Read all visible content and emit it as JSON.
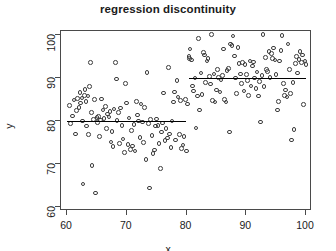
{
  "chart_data": {
    "type": "scatter",
    "title": "regression discontinuity",
    "xlabel": "x",
    "ylabel": "y",
    "xlim": [
      59,
      101
    ],
    "ylim": [
      59,
      101
    ],
    "grid": false,
    "legend": null,
    "xticks": [
      60,
      70,
      80,
      90,
      100
    ],
    "yticks": [
      60,
      70,
      80,
      90,
      100
    ],
    "xtick_labels": [
      "60",
      "70",
      "80",
      "90",
      "100"
    ],
    "ytick_labels": [
      "60",
      "70",
      "80",
      "90",
      "100"
    ],
    "marker": "open-circle",
    "marker_color": "#3c3c3c",
    "line_color": "#000000",
    "cutoff": 80,
    "annotations": [
      {
        "name": "left-segment-level",
        "value": 80.0
      },
      {
        "name": "right-segment-level",
        "value": 90.0
      },
      {
        "name": "discontinuity-jump",
        "value": 10.0
      }
    ],
    "series": [
      {
        "name": "observations",
        "type": "scatter",
        "points": [
          [
            60.4,
            83.6
          ],
          [
            60.6,
            79.4
          ],
          [
            60.9,
            81.2
          ],
          [
            61.2,
            84.9
          ],
          [
            61.4,
            77.0
          ],
          [
            61.6,
            82.4
          ],
          [
            61.8,
            85.2
          ],
          [
            62.0,
            83.1
          ],
          [
            62.2,
            86.6
          ],
          [
            62.3,
            84.2
          ],
          [
            62.5,
            85.4
          ],
          [
            62.6,
            80.0
          ],
          [
            62.7,
            65.3
          ],
          [
            62.9,
            86.0
          ],
          [
            63.0,
            87.3
          ],
          [
            63.2,
            84.6
          ],
          [
            63.3,
            78.8
          ],
          [
            63.5,
            85.8
          ],
          [
            63.6,
            76.9
          ],
          [
            63.8,
            88.0
          ],
          [
            63.9,
            93.7
          ],
          [
            64.1,
            82.0
          ],
          [
            64.2,
            69.6
          ],
          [
            64.4,
            80.4
          ],
          [
            64.6,
            85.0
          ],
          [
            64.8,
            63.2
          ],
          [
            65.0,
            80.8
          ],
          [
            65.1,
            79.6
          ],
          [
            65.3,
            81.0
          ],
          [
            65.4,
            76.4
          ],
          [
            65.6,
            80.2
          ],
          [
            65.8,
            85.1
          ],
          [
            66.0,
            82.6
          ],
          [
            66.2,
            80.6
          ],
          [
            66.4,
            83.4
          ],
          [
            66.6,
            78.3
          ],
          [
            66.8,
            81.6
          ],
          [
            67.0,
            80.9
          ],
          [
            67.2,
            82.2
          ],
          [
            67.4,
            75.1
          ],
          [
            67.5,
            77.6
          ],
          [
            67.7,
            74.0
          ],
          [
            67.9,
            82.8
          ],
          [
            68.1,
            93.6
          ],
          [
            68.3,
            89.8
          ],
          [
            68.4,
            80.1
          ],
          [
            68.6,
            82.0
          ],
          [
            68.8,
            74.7
          ],
          [
            69.0,
            83.0
          ],
          [
            69.2,
            79.0
          ],
          [
            69.4,
            75.8
          ],
          [
            69.6,
            72.6
          ],
          [
            69.8,
            88.8
          ],
          [
            70.0,
            84.2
          ],
          [
            70.2,
            74.5
          ],
          [
            70.4,
            80.7
          ],
          [
            70.6,
            73.4
          ],
          [
            70.8,
            77.8
          ],
          [
            71.0,
            74.2
          ],
          [
            71.2,
            79.2
          ],
          [
            71.4,
            73.0
          ],
          [
            71.6,
            84.6
          ],
          [
            71.8,
            81.4
          ],
          [
            72.0,
            80.0
          ],
          [
            72.2,
            76.2
          ],
          [
            72.4,
            84.0
          ],
          [
            72.6,
            79.8
          ],
          [
            72.8,
            75.0
          ],
          [
            73.0,
            83.2
          ],
          [
            73.2,
            71.0
          ],
          [
            73.4,
            91.3
          ],
          [
            73.6,
            79.4
          ],
          [
            73.8,
            64.4
          ],
          [
            74.0,
            80.3
          ],
          [
            74.2,
            76.6
          ],
          [
            74.4,
            72.4
          ],
          [
            74.6,
            73.2
          ],
          [
            74.8,
            78.8
          ],
          [
            75.0,
            80.5
          ],
          [
            75.2,
            79.0
          ],
          [
            75.4,
            74.8
          ],
          [
            75.6,
            68.9
          ],
          [
            75.8,
            77.4
          ],
          [
            76.0,
            79.5
          ],
          [
            76.2,
            86.5
          ],
          [
            76.4,
            75.4
          ],
          [
            76.6,
            78.2
          ],
          [
            76.8,
            76.0
          ],
          [
            77.0,
            92.5
          ],
          [
            77.2,
            77.0
          ],
          [
            77.4,
            73.8
          ],
          [
            77.6,
            80.0
          ],
          [
            77.8,
            84.4
          ],
          [
            78.0,
            86.8
          ],
          [
            78.2,
            75.6
          ],
          [
            78.4,
            89.4
          ],
          [
            78.6,
            85.6
          ],
          [
            78.8,
            76.8
          ],
          [
            79.0,
            84.8
          ],
          [
            79.2,
            73.6
          ],
          [
            79.4,
            74.4
          ],
          [
            79.6,
            76.4
          ],
          [
            79.8,
            85.0
          ],
          [
            80.0,
            73.0
          ],
          [
            80.2,
            84.0
          ],
          [
            80.4,
            95.1
          ],
          [
            80.5,
            94.6
          ],
          [
            80.6,
            96.8
          ],
          [
            80.8,
            94.2
          ],
          [
            81.0,
            88.2
          ],
          [
            81.2,
            87.0
          ],
          [
            81.4,
            90.0
          ],
          [
            81.6,
            78.4
          ],
          [
            81.8,
            85.8
          ],
          [
            82.0,
            99.2
          ],
          [
            82.2,
            82.6
          ],
          [
            82.4,
            91.2
          ],
          [
            82.6,
            86.2
          ],
          [
            82.8,
            96.0
          ],
          [
            83.0,
            95.4
          ],
          [
            83.2,
            89.0
          ],
          [
            83.4,
            94.0
          ],
          [
            83.6,
            94.6
          ],
          [
            83.8,
            90.4
          ],
          [
            84.0,
            88.6
          ],
          [
            84.2,
            100.2
          ],
          [
            84.4,
            84.8
          ],
          [
            84.6,
            91.0
          ],
          [
            84.8,
            84.4
          ],
          [
            85.0,
            87.2
          ],
          [
            85.2,
            92.0
          ],
          [
            85.4,
            90.2
          ],
          [
            85.6,
            86.8
          ],
          [
            85.8,
            89.6
          ],
          [
            86.0,
            90.6
          ],
          [
            86.2,
            96.8
          ],
          [
            86.4,
            85.0
          ],
          [
            86.6,
            84.4
          ],
          [
            86.8,
            91.8
          ],
          [
            87.0,
            92.2
          ],
          [
            87.2,
            77.4
          ],
          [
            87.4,
            98.0
          ],
          [
            87.6,
            97.6
          ],
          [
            87.8,
            99.8
          ],
          [
            88.0,
            95.2
          ],
          [
            88.2,
            90.0
          ],
          [
            88.4,
            86.4
          ],
          [
            88.6,
            97.2
          ],
          [
            88.8,
            93.4
          ],
          [
            89.0,
            91.0
          ],
          [
            89.2,
            88.8
          ],
          [
            89.4,
            93.6
          ],
          [
            89.6,
            87.0
          ],
          [
            89.8,
            93.2
          ],
          [
            90.0,
            90.8
          ],
          [
            90.2,
            89.4
          ],
          [
            90.4,
            86.0
          ],
          [
            90.6,
            94.0
          ],
          [
            90.8,
            88.2
          ],
          [
            91.0,
            92.8
          ],
          [
            91.2,
            93.8
          ],
          [
            91.4,
            90.0
          ],
          [
            91.6,
            87.6
          ],
          [
            91.8,
            91.4
          ],
          [
            92.0,
            85.8
          ],
          [
            92.2,
            89.2
          ],
          [
            92.4,
            79.8
          ],
          [
            92.6,
            90.6
          ],
          [
            92.8,
            100.2
          ],
          [
            93.0,
            88.0
          ],
          [
            93.2,
            94.8
          ],
          [
            93.4,
            92.0
          ],
          [
            93.6,
            91.6
          ],
          [
            93.8,
            96.2
          ],
          [
            94.0,
            90.2
          ],
          [
            94.2,
            95.8
          ],
          [
            94.4,
            94.6
          ],
          [
            94.6,
            97.0
          ],
          [
            94.8,
            94.2
          ],
          [
            95.0,
            90.8
          ],
          [
            95.2,
            82.6
          ],
          [
            95.4,
            84.6
          ],
          [
            95.6,
            94.0
          ],
          [
            95.8,
            96.4
          ],
          [
            96.0,
            100.0
          ],
          [
            96.2,
            88.8
          ],
          [
            96.4,
            86.0
          ],
          [
            96.6,
            87.2
          ],
          [
            96.8,
            85.6
          ],
          [
            97.0,
            98.0
          ],
          [
            97.2,
            92.0
          ],
          [
            97.4,
            86.4
          ],
          [
            97.6,
            75.6
          ],
          [
            97.8,
            89.0
          ],
          [
            98.0,
            78.0
          ],
          [
            98.2,
            93.4
          ],
          [
            98.4,
            95.0
          ],
          [
            98.6,
            91.2
          ],
          [
            98.8,
            94.4
          ],
          [
            99.0,
            96.2
          ],
          [
            99.2,
            93.6
          ],
          [
            99.4,
            95.4
          ],
          [
            99.6,
            83.8
          ],
          [
            99.8,
            94.0
          ],
          [
            100.0,
            93.2
          ]
        ]
      },
      {
        "name": "fit-left",
        "type": "line",
        "points": [
          [
            60.0,
            80.0
          ],
          [
            80.0,
            80.0
          ]
        ]
      },
      {
        "name": "fit-right",
        "type": "line",
        "points": [
          [
            80.5,
            90.0
          ],
          [
            100.0,
            90.0
          ]
        ]
      }
    ]
  }
}
